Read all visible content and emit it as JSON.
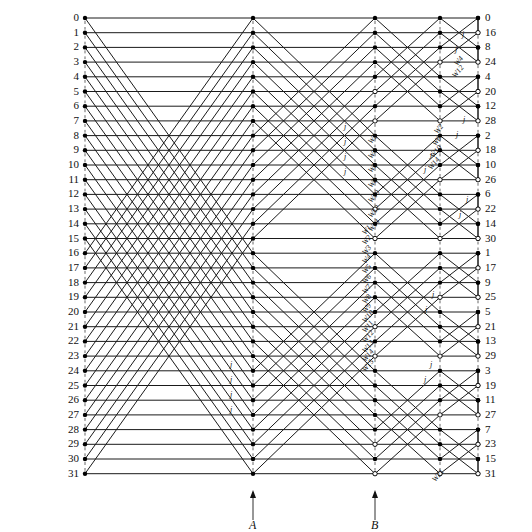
{
  "figure": {
    "type": "fft-butterfly-signal-flow-graph",
    "points": 32,
    "radix": 2,
    "stages": 5,
    "line_color": "#1a1a1a",
    "node_color": "#000000",
    "background": "#ffffff"
  },
  "inputs": {
    "label": "input-index-column",
    "values": [
      "0",
      "1",
      "2",
      "3",
      "4",
      "5",
      "6",
      "7",
      "8",
      "9",
      "10",
      "11",
      "12",
      "13",
      "14",
      "15",
      "16",
      "17",
      "18",
      "19",
      "20",
      "21",
      "22",
      "23",
      "24",
      "25",
      "26",
      "27",
      "28",
      "29",
      "30",
      "31"
    ]
  },
  "outputs": {
    "label": "output-index-column-bit-reversed",
    "values": [
      "0",
      "16",
      "8",
      "24",
      "4",
      "20",
      "12",
      "28",
      "2",
      "18",
      "10",
      "26",
      "6",
      "22",
      "14",
      "30",
      "1",
      "17",
      "9",
      "25",
      "5",
      "21",
      "13",
      "29",
      "3",
      "19",
      "11",
      "27",
      "7",
      "23",
      "15",
      "31"
    ]
  },
  "stage_markers": [
    {
      "name": "A",
      "label": "A",
      "x": 253
    },
    {
      "name": "B",
      "label": "B",
      "x": 375
    }
  ],
  "twiddles": {
    "stage3": [
      "W2",
      "W4",
      "W6",
      "W8",
      "W10",
      "W12",
      "W14"
    ],
    "stage4_lower": [
      "W1",
      "W2",
      "W3",
      "W4",
      "W5",
      "W6",
      "W7",
      "W8",
      "W9",
      "W10",
      "W11",
      "W12",
      "W13",
      "W14",
      "W15"
    ],
    "stage5": [
      "W4",
      "W12",
      "W2",
      "W6",
      "W10",
      "W14",
      "W21"
    ],
    "j_label": "j"
  },
  "chart_data": {
    "type": "diagram",
    "columns_x": [
      85,
      253,
      375,
      440,
      478
    ],
    "row_spacing": 14.7,
    "top_y": 18,
    "n": 32
  }
}
